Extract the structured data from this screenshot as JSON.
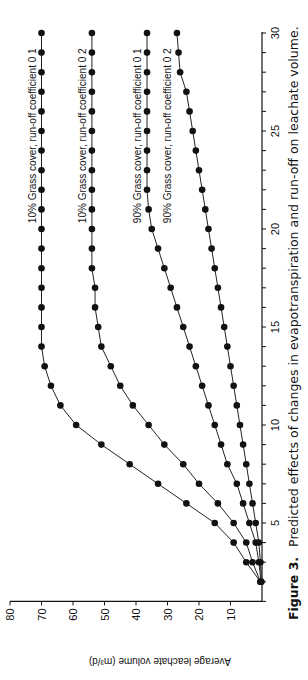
{
  "figure": {
    "caption_label": "Figure 3.",
    "caption_text": "Predicted effects of changes in evapotranspiration and run-off on leachate volume."
  },
  "chart_data": {
    "type": "line",
    "title": "Predicted effects of changes in evapotranspiration and run-off on leachate volume.",
    "xlabel": "",
    "ylabel": "Average leachate volume (m³/d)",
    "xlim": [
      1,
      30
    ],
    "ylim": [
      0,
      80
    ],
    "x_ticks": [
      5,
      10,
      15,
      20,
      25,
      30
    ],
    "y_ticks": [
      10,
      20,
      30,
      40,
      50,
      60,
      70,
      80
    ],
    "grid": false,
    "legend_position": "inline labels at right end of each curve",
    "orientation": "figure rotated 90 degrees counter-clockwise on page",
    "x": [
      2,
      3,
      4,
      5,
      6,
      7,
      8,
      9,
      10,
      11,
      12,
      13,
      14,
      15,
      16,
      17,
      18,
      19,
      20,
      21,
      22,
      23,
      24,
      25,
      26,
      27,
      28,
      29,
      30
    ],
    "series": [
      {
        "name": "10% Grass cover, run-off coefficient 0.1",
        "values": [
          0.5,
          5,
          9,
          15,
          24,
          33,
          42,
          51,
          59,
          64,
          67,
          69,
          70,
          70,
          70,
          70,
          70,
          70,
          70,
          70,
          70,
          70,
          70,
          70,
          70,
          70,
          70,
          70,
          70
        ]
      },
      {
        "name": "10% Grass cover, run-off coefficient 0.2",
        "values": [
          0.5,
          3,
          5,
          9,
          14,
          20,
          25,
          31,
          36,
          41,
          45,
          48,
          51,
          52,
          53,
          53,
          54,
          54,
          54,
          54,
          54,
          54,
          54,
          54,
          54,
          54,
          54,
          54,
          54
        ]
      },
      {
        "name": "90% Grass cover, run-off coefficient 0.1",
        "values": [
          0.3,
          1,
          2,
          4,
          6,
          8,
          11,
          13,
          15,
          17,
          19,
          21,
          23,
          25,
          27,
          29,
          31,
          33,
          35,
          36,
          36.5,
          36.5,
          36.5,
          36.5,
          36.5,
          36.5,
          36.5,
          36.5,
          36.5
        ]
      },
      {
        "name": "90% Grass cover, run-off coefficient 0.2",
        "values": [
          0.2,
          0.5,
          1,
          2,
          3,
          4,
          5,
          6,
          7,
          8,
          9,
          10,
          11,
          12,
          13,
          14,
          15,
          16,
          17,
          18,
          19,
          20,
          21,
          22,
          23,
          24,
          26,
          26.5,
          27
        ]
      }
    ]
  },
  "legend_labels": [
    "10% Grass cover, run-off coefficient 0 1",
    "10% Grass cover, run-off coefficient 0 2",
    "90% Grass cover, run-off coefficient 0 1",
    "90% Grass cover, run-off coefficient 0 2"
  ]
}
